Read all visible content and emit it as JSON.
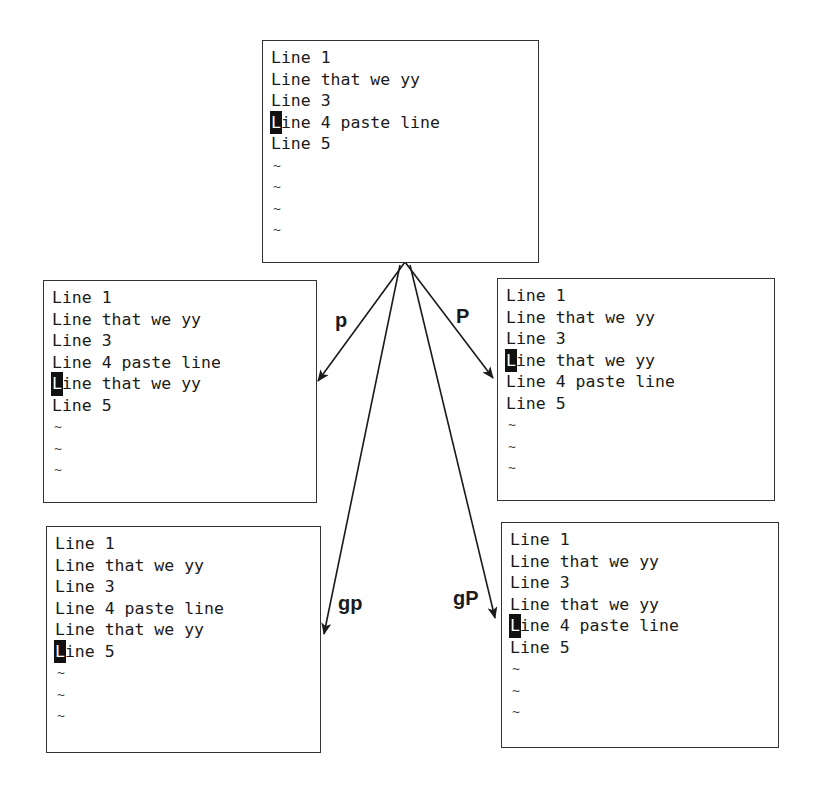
{
  "diagram": {
    "topic": "vim paste commands p, P, gp, gP",
    "source": {
      "lines": [
        {
          "text": "Line 1",
          "cursor": false
        },
        {
          "text": "Line that we yy",
          "cursor": false
        },
        {
          "text": "Line 3",
          "cursor": false
        },
        {
          "text": "Line 4 paste line",
          "cursor": true
        },
        {
          "text": "Line 5",
          "cursor": false
        }
      ],
      "tildes": [
        "~",
        "~",
        "~",
        "~"
      ]
    },
    "results": [
      {
        "command": "p",
        "lines": [
          {
            "text": "Line 1",
            "cursor": false
          },
          {
            "text": "Line that we yy",
            "cursor": false
          },
          {
            "text": "Line 3",
            "cursor": false
          },
          {
            "text": "Line 4 paste line",
            "cursor": false
          },
          {
            "text": "Line that we yy",
            "cursor": true
          },
          {
            "text": "Line 5",
            "cursor": false
          }
        ],
        "tildes": [
          "~",
          "~",
          "~"
        ]
      },
      {
        "command": "P",
        "lines": [
          {
            "text": "Line 1",
            "cursor": false
          },
          {
            "text": "Line that we yy",
            "cursor": false
          },
          {
            "text": "Line 3",
            "cursor": false
          },
          {
            "text": "Line that we yy",
            "cursor": true
          },
          {
            "text": "Line 4 paste line",
            "cursor": false
          },
          {
            "text": "Line 5",
            "cursor": false
          }
        ],
        "tildes": [
          "~",
          "~",
          "~"
        ]
      },
      {
        "command": "gp",
        "lines": [
          {
            "text": "Line 1",
            "cursor": false
          },
          {
            "text": "Line that we yy",
            "cursor": false
          },
          {
            "text": "Line 3",
            "cursor": false
          },
          {
            "text": "Line 4 paste line",
            "cursor": false
          },
          {
            "text": "Line that we yy",
            "cursor": false
          },
          {
            "text": "Line 5",
            "cursor": true
          }
        ],
        "tildes": [
          "~",
          "~",
          "~"
        ]
      },
      {
        "command": "gP",
        "lines": [
          {
            "text": "Line 1",
            "cursor": false
          },
          {
            "text": "Line that we yy",
            "cursor": false
          },
          {
            "text": "Line 3",
            "cursor": false
          },
          {
            "text": "Line that we yy",
            "cursor": false
          },
          {
            "text": "Line 4 paste line",
            "cursor": true
          },
          {
            "text": "Line 5",
            "cursor": false
          }
        ],
        "tildes": [
          "~",
          "~",
          "~"
        ]
      }
    ],
    "colors": {
      "line": "#333333",
      "text": "#1a1a1a",
      "cursor_bg": "#111111",
      "background": "#ffffff"
    }
  }
}
